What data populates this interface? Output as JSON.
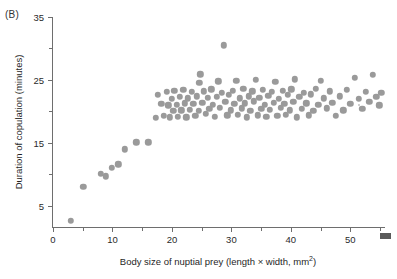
{
  "figure": {
    "panel_label": "(B)",
    "background_color": "#ffffff",
    "point_color": "#9a9a9a",
    "axis_color": "#6e6e6e"
  },
  "axes": {
    "x": {
      "title_prefix": "Body size of nuptial prey (length × width, mm",
      "title_sup": "2",
      "title_suffix": ")",
      "title_full": "Body size of nuptial prey (length × width, mm2)",
      "major_ticks": [
        0,
        10,
        20,
        30,
        40,
        50
      ],
      "minor_ticks": [
        5,
        15,
        25,
        35,
        45,
        55
      ],
      "labels": [
        "0",
        "10",
        "20",
        "30",
        "40",
        "50"
      ],
      "min": 0,
      "max": 56
    },
    "y": {
      "title": "Duration of copulation (minutes)",
      "major_ticks": [
        5,
        15,
        25,
        35
      ],
      "minor_ticks": [
        10,
        20,
        30
      ],
      "labels": [
        "5",
        "15",
        "25",
        "35"
      ],
      "min": 1.5,
      "max": 35
    }
  },
  "chart_data": {
    "type": "scatter",
    "title": "",
    "subtitle": "",
    "xlabel": "Body size of nuptial prey (length × width, mm2)",
    "ylabel": "Duration of copulation (minutes)",
    "xlim": [
      0,
      56
    ],
    "ylim": [
      1.5,
      35
    ],
    "grid": false,
    "legend": null,
    "marker": {
      "shape": "circle",
      "color": "#9a9a9a",
      "size_px": 6.4
    },
    "annotations": [
      "(B)"
    ],
    "n_points": 118,
    "points": [
      [
        3.0,
        2.6
      ],
      [
        5.1,
        8.0
      ],
      [
        8.0,
        10.1
      ],
      [
        8.9,
        9.7
      ],
      [
        9.9,
        11.1
      ],
      [
        11.0,
        11.6
      ],
      [
        12.1,
        14.0
      ],
      [
        14.0,
        15.1
      ],
      [
        16.0,
        15.1
      ],
      [
        17.3,
        19.0
      ],
      [
        17.6,
        22.6
      ],
      [
        18.2,
        21.2
      ],
      [
        18.6,
        19.3
      ],
      [
        19.1,
        23.1
      ],
      [
        19.4,
        21.0
      ],
      [
        19.6,
        19.1
      ],
      [
        20.0,
        22.0
      ],
      [
        20.2,
        20.1
      ],
      [
        20.4,
        23.3
      ],
      [
        20.8,
        21.1
      ],
      [
        21.0,
        19.2
      ],
      [
        21.3,
        22.3
      ],
      [
        21.6,
        20.2
      ],
      [
        21.9,
        23.4
      ],
      [
        22.2,
        21.3
      ],
      [
        22.4,
        19.1
      ],
      [
        22.7,
        22.1
      ],
      [
        23.0,
        20.3
      ],
      [
        23.3,
        23.1
      ],
      [
        23.6,
        21.2
      ],
      [
        23.9,
        19.3
      ],
      [
        24.2,
        22.4
      ],
      [
        24.5,
        20.1
      ],
      [
        24.6,
        24.6
      ],
      [
        24.8,
        25.9
      ],
      [
        25.1,
        21.4
      ],
      [
        25.4,
        23.2
      ],
      [
        25.7,
        19.6
      ],
      [
        26.0,
        22.2
      ],
      [
        26.3,
        20.4
      ],
      [
        26.6,
        23.5
      ],
      [
        26.9,
        21.1
      ],
      [
        27.2,
        19.2
      ],
      [
        27.5,
        22.3
      ],
      [
        27.8,
        24.8
      ],
      [
        28.1,
        20.6
      ],
      [
        28.4,
        23.0
      ],
      [
        28.7,
        30.5
      ],
      [
        29.0,
        21.5
      ],
      [
        29.3,
        19.4
      ],
      [
        29.6,
        22.6
      ],
      [
        29.9,
        20.2
      ],
      [
        30.2,
        23.3
      ],
      [
        30.5,
        21.2
      ],
      [
        30.8,
        24.9
      ],
      [
        31.1,
        19.5
      ],
      [
        31.4,
        22.1
      ],
      [
        31.7,
        20.5
      ],
      [
        32.0,
        23.6
      ],
      [
        32.3,
        21.3
      ],
      [
        32.6,
        19.1
      ],
      [
        32.9,
        22.4
      ],
      [
        33.2,
        20.1
      ],
      [
        33.5,
        23.2
      ],
      [
        33.8,
        21.6
      ],
      [
        34.1,
        25.0
      ],
      [
        34.4,
        19.4
      ],
      [
        34.7,
        22.2
      ],
      [
        35.0,
        20.4
      ],
      [
        35.3,
        23.4
      ],
      [
        35.6,
        21.1
      ],
      [
        35.9,
        19.2
      ],
      [
        36.2,
        22.5
      ],
      [
        36.5,
        20.3
      ],
      [
        36.8,
        23.1
      ],
      [
        37.1,
        21.4
      ],
      [
        37.4,
        24.7
      ],
      [
        37.7,
        19.3
      ],
      [
        38.0,
        22.0
      ],
      [
        38.3,
        20.6
      ],
      [
        38.6,
        23.3
      ],
      [
        38.9,
        21.2
      ],
      [
        39.2,
        19.5
      ],
      [
        39.5,
        22.6
      ],
      [
        39.8,
        20.2
      ],
      [
        40.1,
        23.5
      ],
      [
        40.4,
        21.5
      ],
      [
        40.7,
        25.1
      ],
      [
        41.0,
        19.1
      ],
      [
        41.4,
        22.3
      ],
      [
        41.8,
        20.4
      ],
      [
        42.2,
        23.0
      ],
      [
        42.6,
        21.3
      ],
      [
        43.0,
        19.4
      ],
      [
        43.4,
        22.7
      ],
      [
        43.8,
        20.1
      ],
      [
        44.2,
        23.6
      ],
      [
        44.6,
        21.1
      ],
      [
        45.0,
        24.9
      ],
      [
        45.5,
        22.1
      ],
      [
        46.0,
        20.5
      ],
      [
        46.5,
        23.2
      ],
      [
        47.0,
        21.4
      ],
      [
        47.6,
        19.3
      ],
      [
        48.2,
        22.4
      ],
      [
        48.8,
        20.2
      ],
      [
        49.4,
        23.4
      ],
      [
        50.0,
        21.2
      ],
      [
        50.8,
        25.3
      ],
      [
        51.4,
        22.0
      ],
      [
        52.0,
        20.4
      ],
      [
        52.6,
        23.1
      ],
      [
        53.2,
        21.5
      ],
      [
        53.8,
        25.8
      ],
      [
        54.4,
        22.3
      ],
      [
        54.9,
        21.0
      ],
      [
        55.2,
        23.0
      ]
    ]
  }
}
